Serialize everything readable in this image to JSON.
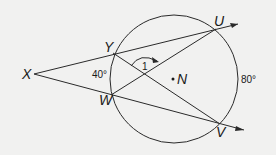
{
  "diagram": {
    "points": {
      "X": "X",
      "Y": "Y",
      "W": "W",
      "U": "U",
      "V": "V",
      "N": "N"
    },
    "angle_label": "1",
    "arc_labels": {
      "minor_YW": "40°",
      "major_UV": "80°"
    },
    "colors": {
      "line": "#2a2a2a",
      "background": "#f1f1f0"
    }
  }
}
